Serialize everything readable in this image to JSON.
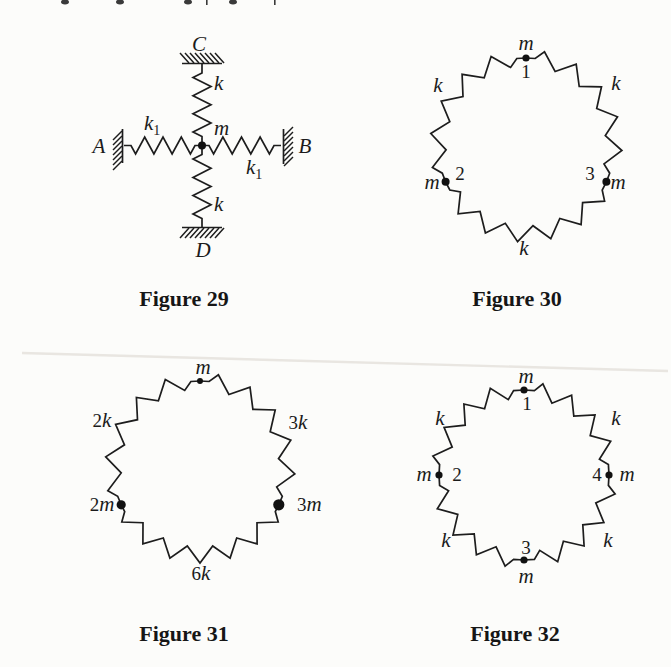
{
  "ink_color": "#1d1d1d",
  "figures": {
    "fig29": {
      "caption": "Figure 29",
      "wall_top": "C",
      "wall_left": "A",
      "wall_right": "B",
      "wall_bottom": "D",
      "spring_top": "k",
      "spring_bottom": "k",
      "spring_left_sym": "k",
      "spring_left_sub": "1",
      "spring_right_sym": "k",
      "spring_right_sub": "1",
      "mass": "m"
    },
    "fig30": {
      "caption": "Figure 30",
      "mass_top": "m",
      "mass_top_num": "1",
      "mass_left": "m",
      "mass_left_num": "2",
      "mass_right": "m",
      "mass_right_num": "3",
      "spring_upper_left": "k",
      "spring_upper_right": "k",
      "spring_bottom": "k"
    },
    "fig31": {
      "caption": "Figure 31",
      "mass_top": "m",
      "mass_left_num": "2",
      "mass_left_sym": "m",
      "mass_right_num": "3",
      "mass_right_sym": "m",
      "spring_upper_left_num": "2",
      "spring_upper_left_sym": "k",
      "spring_upper_right_num": "3",
      "spring_upper_right_sym": "k",
      "spring_bottom_num": "6",
      "spring_bottom_sym": "k"
    },
    "fig32": {
      "caption": "Figure 32",
      "mass_top": "m",
      "mass_top_num": "1",
      "mass_left": "m",
      "mass_left_num": "2",
      "mass_right": "m",
      "mass_right_num": "4",
      "mass_bottom": "m",
      "mass_bottom_num": "3",
      "spring_upper_left": "k",
      "spring_upper_right": "k",
      "spring_lower_left": "k",
      "spring_lower_right": "k"
    }
  }
}
